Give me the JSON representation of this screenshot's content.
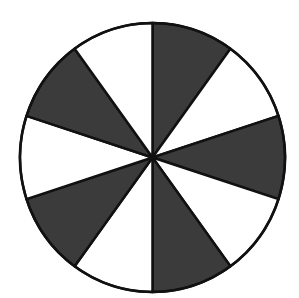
{
  "diagram": {
    "type": "sectored-circle",
    "sector_count": 10,
    "shaded_count": 5,
    "unshaded_count": 5,
    "sector_angle_deg": 36,
    "start_angle_deg": 0,
    "pattern": [
      "shaded",
      "white",
      "shaded",
      "white",
      "shaded",
      "white",
      "shaded",
      "white",
      "shaded",
      "white"
    ],
    "colors": {
      "shaded": "#3b3b3b",
      "white": "#ffffff",
      "stroke": "#111111"
    },
    "geometry": {
      "cx": 152.5,
      "cy": 157.5,
      "rx": 132.5,
      "ry": 134.5,
      "stroke_width": 2.5
    }
  }
}
